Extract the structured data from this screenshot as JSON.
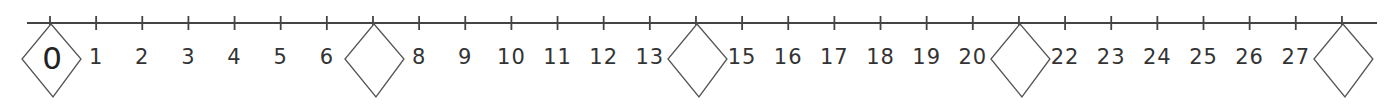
{
  "number_line": {
    "start": 0,
    "end": 28,
    "tick_spacing_px": 46.14,
    "line": {
      "x1": 27,
      "x2": 1377,
      "y": 23,
      "color": "#444444"
    },
    "labels": [
      {
        "value": 1,
        "text": "1"
      },
      {
        "value": 2,
        "text": "2"
      },
      {
        "value": 3,
        "text": "3"
      },
      {
        "value": 4,
        "text": "4"
      },
      {
        "value": 5,
        "text": "5"
      },
      {
        "value": 6,
        "text": "6"
      },
      {
        "value": 8,
        "text": "8"
      },
      {
        "value": 9,
        "text": "9"
      },
      {
        "value": 10,
        "text": "10"
      },
      {
        "value": 11,
        "text": "11"
      },
      {
        "value": 12,
        "text": "12"
      },
      {
        "value": 13,
        "text": "13"
      },
      {
        "value": 15,
        "text": "15"
      },
      {
        "value": 16,
        "text": "16"
      },
      {
        "value": 17,
        "text": "17"
      },
      {
        "value": 18,
        "text": "18"
      },
      {
        "value": 19,
        "text": "19"
      },
      {
        "value": 20,
        "text": "20"
      },
      {
        "value": 22,
        "text": "22"
      },
      {
        "value": 23,
        "text": "23"
      },
      {
        "value": 24,
        "text": "24"
      },
      {
        "value": 25,
        "text": "25"
      },
      {
        "value": 26,
        "text": "26"
      },
      {
        "value": 27,
        "text": "27"
      }
    ],
    "diamonds": [
      {
        "value": 0,
        "text": "0"
      },
      {
        "value": 7,
        "text": ""
      },
      {
        "value": 14,
        "text": ""
      },
      {
        "value": 21,
        "text": ""
      },
      {
        "value": 28,
        "text": ""
      }
    ]
  }
}
